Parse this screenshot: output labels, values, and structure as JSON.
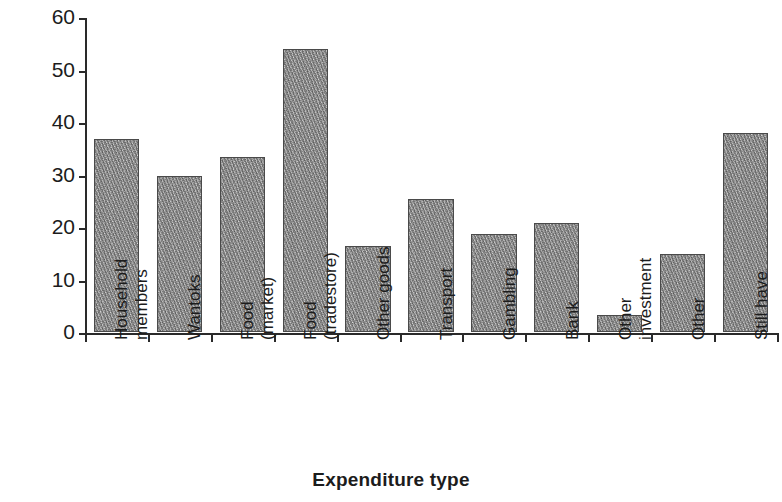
{
  "chart_data": {
    "type": "bar",
    "title": "",
    "xlabel": "Expenditure type",
    "ylabel": "Per cent",
    "ylim": [
      0,
      60
    ],
    "ytick_step": 10,
    "yticks": [
      0,
      10,
      20,
      30,
      40,
      50,
      60
    ],
    "ytick_labels": [
      "0",
      "10",
      "20",
      "30",
      "40",
      "50",
      "60"
    ],
    "grid": false,
    "legend": null,
    "bar_fill_color": "#9c9c9c",
    "bar_edge_color": "#4a4a4a",
    "axis_color": "#2a2a2a",
    "categories": [
      "Household\nmembers",
      "Wantoks",
      "Food\n(market)",
      "Food\n(tradestore)",
      "Other goods",
      "Transport",
      "Gambling",
      "Bank",
      "Other\ninvestment",
      "Other",
      "Still have"
    ],
    "values": [
      36.8,
      29.8,
      33.3,
      54.0,
      16.4,
      25.4,
      18.6,
      20.8,
      3.2,
      14.8,
      38.0
    ]
  }
}
